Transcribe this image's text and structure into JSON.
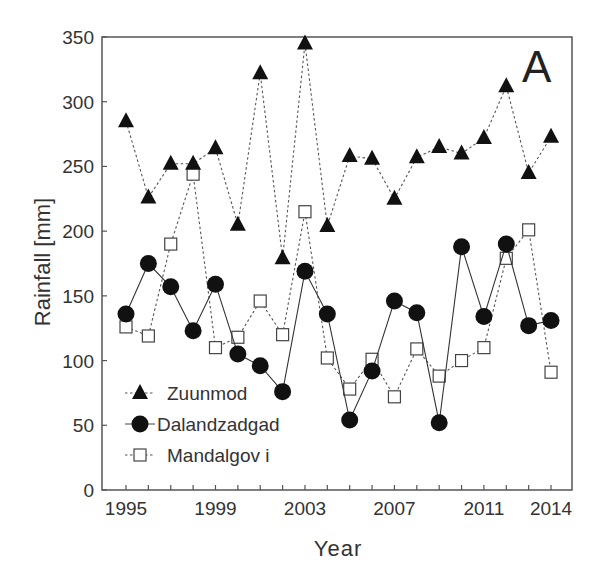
{
  "chart_data": {
    "type": "line",
    "title": "",
    "panel_label": "A",
    "xlabel": "Year",
    "ylabel": "Rainfall [mm]",
    "ylim": [
      0,
      350
    ],
    "xlim": [
      1994.2,
      2014.9
    ],
    "yticks": [
      0,
      50,
      100,
      150,
      200,
      250,
      300,
      350
    ],
    "xtick_labels": [
      "1995",
      "1999",
      "2003",
      "2007",
      "2011",
      "2014"
    ],
    "grid": false,
    "legend_position": "lower-left",
    "x": [
      1995,
      1996,
      1997,
      1998,
      1999,
      2000,
      2001,
      2002,
      2003,
      2004,
      2005,
      2006,
      2007,
      2008,
      2009,
      2010,
      2011,
      2012,
      2013,
      2014
    ],
    "series": [
      {
        "name": "Zuunmod",
        "marker": "filled-triangle",
        "line": "dotted",
        "values": [
          285,
          226,
          252,
          252,
          264,
          205,
          322,
          179,
          345,
          204,
          258,
          256,
          225,
          257,
          265,
          260,
          272,
          312,
          245,
          273
        ]
      },
      {
        "name": "Dalandzadgad",
        "marker": "filled-circle",
        "line": "solid",
        "values": [
          136,
          175,
          157,
          123,
          159,
          105,
          96,
          76,
          169,
          136,
          54,
          92,
          146,
          137,
          52,
          188,
          134,
          190,
          127,
          131
        ]
      },
      {
        "name": "Mandalgov i",
        "marker": "open-square",
        "line": "dotted",
        "values": [
          126,
          119,
          190,
          244,
          110,
          118,
          146,
          120,
          215,
          102,
          78,
          101,
          72,
          109,
          88,
          100,
          110,
          179,
          201,
          91
        ]
      }
    ]
  },
  "colors": {
    "ink": "#111111",
    "axis": "#555555",
    "background": "#ffffff"
  }
}
